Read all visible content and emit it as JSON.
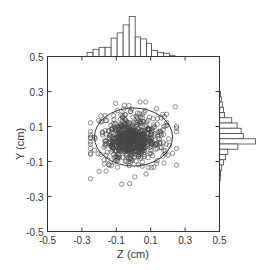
{
  "chart_data": {
    "type": "scatter",
    "title": "",
    "xlabel": "Z (cm)",
    "ylabel": "Y (cm)",
    "xlim": [
      -0.5,
      0.5
    ],
    "ylim": [
      -0.5,
      0.5
    ],
    "xticks": [
      -0.5,
      -0.3,
      -0.1,
      0.1,
      0.3,
      0.5
    ],
    "yticks": [
      -0.5,
      -0.3,
      -0.1,
      0.1,
      0.3,
      0.5
    ],
    "xtick_labels": [
      "-0.5",
      "-0.3",
      "-0.1",
      "0.1",
      "0.3",
      "0.5"
    ],
    "ytick_labels": [
      "-0.5",
      "-0.3",
      "-0.1",
      "0.1",
      "0.3",
      "0.5"
    ],
    "grid": false,
    "marker": "open-circle",
    "scatter_distribution": {
      "approx_count": 700,
      "center": [
        0.0,
        0.03
      ],
      "dense_core_center": [
        -0.02,
        0.02
      ],
      "z_range": [
        -0.25,
        0.25
      ],
      "y_range": [
        -0.23,
        0.24
      ]
    },
    "ellipse": {
      "cx": 0.0,
      "cy": 0.04,
      "rx": 0.227,
      "ry": 0.166
    },
    "top_histogram": {
      "orientation": "vertical",
      "axis": "Z",
      "bin_edges": [
        -0.27,
        -0.235,
        -0.2,
        -0.165,
        -0.13,
        -0.095,
        -0.06,
        -0.025,
        0.01,
        0.04,
        0.075,
        0.105,
        0.14,
        0.175,
        0.21,
        0.24
      ],
      "relative_heights": [
        0.1,
        0.18,
        0.23,
        0.23,
        0.46,
        0.59,
        0.79,
        1.0,
        0.49,
        0.44,
        0.33,
        0.15,
        0.1,
        0.08,
        0.03
      ]
    },
    "right_histogram": {
      "orientation": "horizontal",
      "axis": "Y",
      "bin_edges": [
        0.3,
        0.27,
        0.24,
        0.21,
        0.18,
        0.15,
        0.12,
        0.09,
        0.06,
        0.03,
        0.0,
        -0.03,
        -0.06,
        -0.09,
        -0.12,
        -0.15,
        -0.18,
        -0.21
      ],
      "relative_lengths": [
        0.03,
        0.05,
        0.08,
        0.11,
        0.14,
        0.34,
        0.49,
        0.6,
        0.66,
        1.0,
        0.51,
        0.23,
        0.17,
        0.11,
        0.06,
        0.03,
        0.02
      ]
    }
  },
  "colors": {
    "axis": "#333333",
    "marker": "#444444",
    "bar_fill": "#ffffff",
    "bar_stroke": "#444444"
  }
}
